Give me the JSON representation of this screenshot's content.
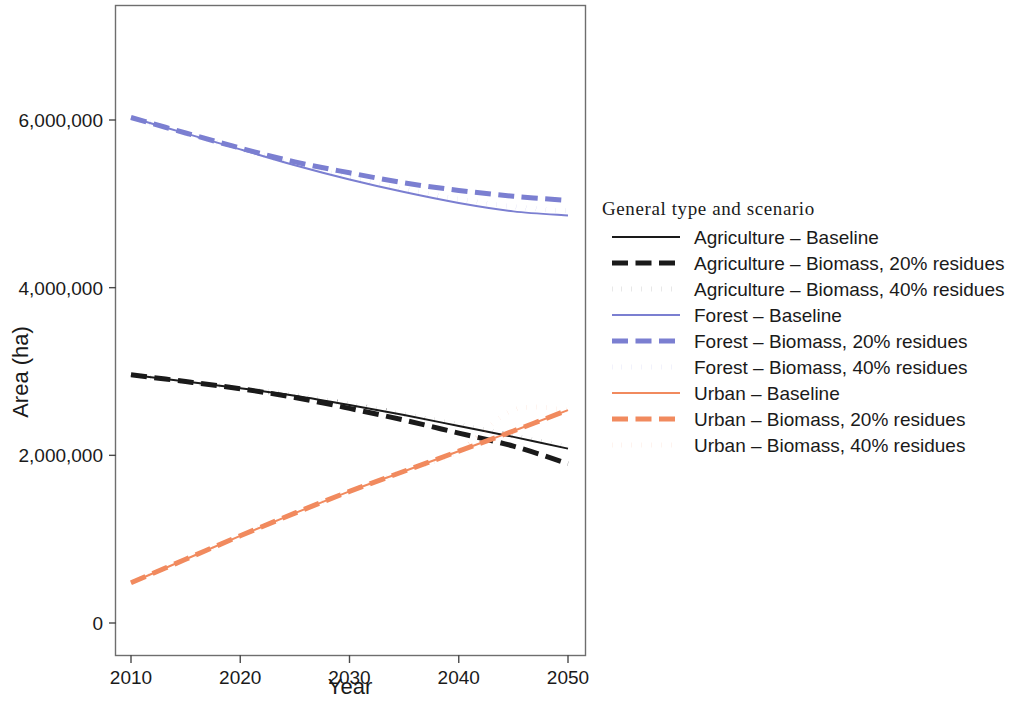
{
  "chart_data": {
    "type": "line",
    "title": "",
    "xlabel": "Year",
    "ylabel": "Area (ha)",
    "xlim": [
      2010,
      2050
    ],
    "ylim": [
      0,
      7000000
    ],
    "xticks": [
      2010,
      2020,
      2030,
      2040,
      2050
    ],
    "xtick_labels": [
      "2010",
      "2020",
      "2030",
      "2040",
      "2050"
    ],
    "yticks": [
      0,
      2000000,
      4000000,
      6000000
    ],
    "ytick_labels": [
      "0",
      "2,000,000",
      "4,000,000",
      "6,000,000"
    ],
    "grid": false,
    "legend_position": "right",
    "legend_title": "General type and scenario",
    "x": [
      2010,
      2015,
      2020,
      2025,
      2030,
      2035,
      2040,
      2045,
      2050
    ],
    "series": [
      {
        "name": "Agriculture – Baseline",
        "group": "Agriculture",
        "scenario": "Baseline",
        "color": "#1a1a1a",
        "dash": "solid",
        "width": 2,
        "values": [
          2960000,
          2880000,
          2800000,
          2710000,
          2600000,
          2480000,
          2350000,
          2220000,
          2080000
        ]
      },
      {
        "name": "Agriculture – Biomass, 20% residues",
        "group": "Agriculture",
        "scenario": "Biomass, 20% residues",
        "color": "#1a1a1a",
        "dash": "dashed",
        "width": 5,
        "values": [
          2960000,
          2880000,
          2795000,
          2690000,
          2560000,
          2420000,
          2265000,
          2110000,
          1900000
        ]
      },
      {
        "name": "Agriculture – Biomass, 40% residues",
        "group": "Agriculture",
        "scenario": "Biomass, 40% residues",
        "color": "#1a1a1a",
        "dash": "dotted",
        "width": 5,
        "values": [
          2960000,
          2880000,
          2800000,
          2715000,
          2610000,
          2490000,
          2365000,
          2235000,
          2095000
        ]
      },
      {
        "name": "Forest – Baseline",
        "group": "Forest",
        "scenario": "Baseline",
        "color": "#7b7fd1",
        "dash": "solid",
        "width": 2,
        "values": [
          6030000,
          5840000,
          5650000,
          5460000,
          5290000,
          5140000,
          5010000,
          4910000,
          4860000
        ]
      },
      {
        "name": "Forest – Biomass, 20% residues",
        "group": "Forest",
        "scenario": "Biomass, 20% residues",
        "color": "#7b7fd1",
        "dash": "dashed",
        "width": 5,
        "values": [
          6030000,
          5845000,
          5665000,
          5500000,
          5370000,
          5250000,
          5160000,
          5090000,
          5040000
        ]
      },
      {
        "name": "Forest – Biomass, 40% residues",
        "group": "Forest",
        "scenario": "Biomass, 40% residues",
        "color": "#7b7fd1",
        "dash": "dotted",
        "width": 5,
        "values": [
          6030000,
          5842000,
          5655000,
          5475000,
          5315000,
          5175000,
          5055000,
          4965000,
          4915000
        ]
      },
      {
        "name": "Urban – Baseline",
        "group": "Urban",
        "scenario": "Baseline",
        "color": "#f18a5e",
        "dash": "solid",
        "width": 2,
        "values": [
          480000,
          760000,
          1040000,
          1310000,
          1570000,
          1810000,
          2050000,
          2290000,
          2540000
        ]
      },
      {
        "name": "Urban – Biomass, 20% residues",
        "group": "Urban",
        "scenario": "Biomass, 20% residues",
        "color": "#f18a5e",
        "dash": "dashed",
        "width": 5,
        "values": [
          480000,
          760000,
          1040000,
          1310000,
          1570000,
          1810000,
          2050000,
          2290000,
          2540000
        ]
      },
      {
        "name": "Urban – Biomass, 40% residues",
        "group": "Urban",
        "scenario": "Biomass, 40% residues",
        "color": "#f18a5e",
        "dash": "dotted",
        "width": 5,
        "values": [
          480000,
          760000,
          1040000,
          1310000,
          1570000,
          1810000,
          2050000,
          2540000,
          2540000
        ]
      }
    ],
    "colors": {
      "agriculture": "#1a1a1a",
      "forest": "#7b7fd1",
      "urban": "#f18a5e",
      "panel_border": "#6e6e6e",
      "background": "#ffffff"
    }
  }
}
